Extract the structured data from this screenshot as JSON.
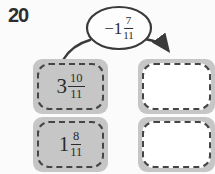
{
  "exercise_number": "20",
  "bubble": {
    "whole": "−1",
    "numerator": "7",
    "denominator": "11"
  },
  "left_cards": [
    {
      "whole": "3",
      "numerator": "10",
      "denominator": "11"
    },
    {
      "whole": "1",
      "numerator": "8",
      "denominator": "11"
    }
  ],
  "answer_boxes": [
    "",
    ""
  ],
  "colors": {
    "card_gray": "#c6c6c6",
    "dash": "#454545",
    "ink": "#2b2b2b",
    "outline": "#3a3a3a",
    "background": "#fbfbfb"
  }
}
